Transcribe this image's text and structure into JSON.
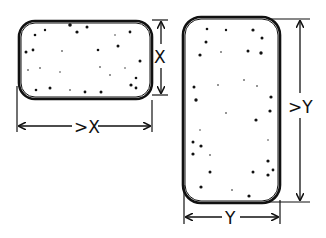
{
  "diagram": {
    "shapes": [
      {
        "id": "landscape-block",
        "description": "Speckled rounded rectangle, wider than tall",
        "height_label": "X",
        "width_label": ">X"
      },
      {
        "id": "portrait-block",
        "description": "Speckled rounded rectangle, taller than wide",
        "height_label": ">Y",
        "width_label": "Y"
      }
    ],
    "ink_color": "#111111",
    "background_color": "#ffffff"
  }
}
